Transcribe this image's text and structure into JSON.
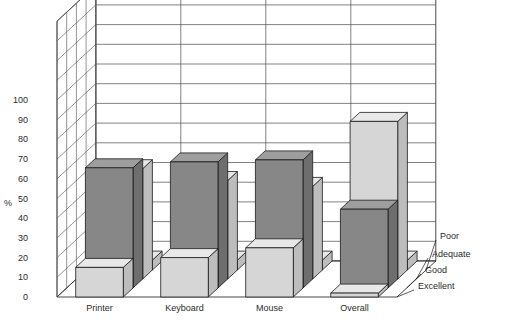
{
  "chart_data": {
    "type": "bar",
    "title": "Self-Assessed Competence",
    "xlabel": "",
    "ylabel": "%",
    "ylim": [
      0,
      100
    ],
    "ytick_step": 10,
    "yticks": [
      "0",
      "10",
      "20",
      "30",
      "40",
      "50",
      "60",
      "70",
      "80",
      "90",
      "100"
    ],
    "grid": true,
    "legend_position": "right-depth-axis",
    "projection": "3d-columns",
    "categories": [
      "Printer",
      "Keyboard",
      "Mouse",
      "Overall"
    ],
    "depth_categories": [
      "Excellent",
      "Good",
      "Adequate",
      "Poor"
    ],
    "series": [
      {
        "name": "Excellent",
        "values": [
          15,
          20,
          25,
          2
        ]
      },
      {
        "name": "Good",
        "values": [
          61,
          64,
          65,
          40
        ]
      },
      {
        "name": "Adequate",
        "values": [
          56,
          50,
          47,
          80
        ]
      },
      {
        "name": "Poor",
        "values": [
          5,
          5,
          5,
          5
        ]
      }
    ],
    "series_colors": [
      "#d4d4d4",
      "#868686",
      "#d4d4d4",
      "#d4d4d4"
    ]
  },
  "style": {
    "background": "#ffffff",
    "axis_color": "#1a1a1a",
    "grid_color": "#4d4d4d",
    "text_color": "#2b2b2b",
    "light_fill": "#d6d6d6",
    "light_top": "#e8e8e8",
    "light_side": "#bdbdbd",
    "dark_fill": "#878787",
    "dark_top": "#9e9e9e",
    "dark_side": "#6e6e6e"
  }
}
